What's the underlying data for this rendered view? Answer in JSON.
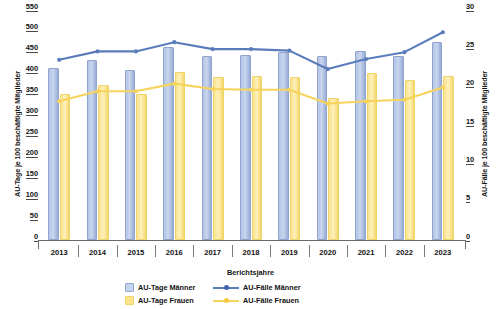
{
  "chart_data": {
    "type": "bar",
    "title": "",
    "xlabel": "Berichtsjahre",
    "ylabel": "AU-Tage je 100 beschäftigte Mitglieder",
    "y2label": "AU-Fälle je 100 beschäftigte Mitglieder",
    "categories": [
      "2013",
      "2014",
      "2015",
      "2016",
      "2017",
      "2018",
      "2019",
      "2020",
      "2021",
      "2022",
      "2023"
    ],
    "ylim": [
      0,
      550
    ],
    "yticks": [
      0,
      50,
      100,
      150,
      200,
      250,
      300,
      350,
      400,
      450,
      500,
      550
    ],
    "y2lim": [
      0,
      30
    ],
    "y2ticks": [
      0,
      5,
      10,
      15,
      20,
      25,
      30
    ],
    "grid": false,
    "legend_position": "bottom",
    "series": [
      {
        "name": "AU-Tage Männer",
        "type": "bar",
        "axis": "left",
        "color": "#c6d3ec",
        "values": [
          411,
          431,
          406,
          462,
          441,
          443,
          450,
          439,
          452,
          441,
          473
        ]
      },
      {
        "name": "AU-Tage Frauen",
        "type": "bar",
        "axis": "left",
        "color": "#fbe48c",
        "values": [
          350,
          370,
          350,
          402,
          390,
          392,
          390,
          340,
          400,
          382,
          392
        ]
      },
      {
        "name": "AU-Fälle Männer",
        "type": "line",
        "axis": "right",
        "color": "#5b7cba",
        "values": [
          23.5,
          24.6,
          24.6,
          25.8,
          24.9,
          24.9,
          24.7,
          22.3,
          23.6,
          24.5,
          27.1
        ]
      },
      {
        "name": "AU-Fälle Frauen",
        "type": "line",
        "axis": "right",
        "color": "#f6d45b",
        "values": [
          18.1,
          19.4,
          19.4,
          20.4,
          19.7,
          19.6,
          19.6,
          17.8,
          18.1,
          18.3,
          19.9
        ]
      }
    ]
  },
  "legend": {
    "items": [
      {
        "label": "AU-Tage Männer",
        "marker": "box-male-icon"
      },
      {
        "label": "AU-Fälle Männer",
        "marker": "line-male-icon"
      },
      {
        "label": "AU-Tage Frauen",
        "marker": "box-female-icon"
      },
      {
        "label": "AU-Fälle Frauen",
        "marker": "line-female-icon"
      }
    ]
  },
  "colors": {
    "bar_male": "#c6d3ec",
    "bar_female": "#fbe48c",
    "line_male": "#5b7cba",
    "line_female": "#f6d45b",
    "axis": "#5a5a5a",
    "text": "#111111"
  }
}
